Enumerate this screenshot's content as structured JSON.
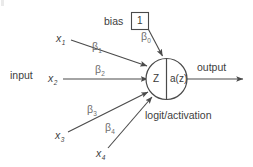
{
  "diagram": {
    "background_color": "#ffffff",
    "stroke_color": "#4a4a4a",
    "text_color": "#3a3a3a",
    "beta_color": "#6e6e6e"
  },
  "labels": {
    "input": "input",
    "bias": "bias",
    "bias_value": "1",
    "output": "output",
    "caption": "logit/activation"
  },
  "node": {
    "left_text": "Z",
    "right_text": "a(z)"
  },
  "inputs": [
    {
      "name": "x",
      "sub": "1",
      "weight_name": "β",
      "weight_sub": "1"
    },
    {
      "name": "x",
      "sub": "2",
      "weight_name": "β",
      "weight_sub": "2"
    },
    {
      "name": "x",
      "sub": "3",
      "weight_name": "β",
      "weight_sub": "3"
    },
    {
      "name": "x",
      "sub": "4",
      "weight_name": "β",
      "weight_sub": "4"
    }
  ],
  "bias_weight": {
    "weight_name": "β",
    "weight_sub": "0"
  }
}
